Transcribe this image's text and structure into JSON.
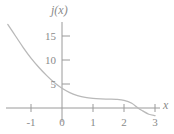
{
  "chart_data": {
    "type": "line",
    "title": "",
    "xlabel": "x",
    "ylabel": "j(x)",
    "xlim": [
      -1.75,
      3.25
    ],
    "ylim": [
      -1.6,
      17.5
    ],
    "grid": false,
    "legend": null,
    "axis_color": "#9a9a9a",
    "curve_color": "#b9b9b9",
    "label_color": "#8a8a8a",
    "background": "#ffffff",
    "xticks": [
      -1,
      0,
      1,
      2,
      3
    ],
    "xtick_labels": [
      "-1",
      "0",
      "1",
      "2",
      "3"
    ],
    "yticks": [
      5,
      10,
      15
    ],
    "ytick_labels": [
      "5",
      "10",
      "15"
    ],
    "series": [
      {
        "name": "j(x)",
        "x": [
          -1.75,
          -1.5,
          -1.25,
          -1.0,
          -0.75,
          -0.5,
          -0.25,
          0.0,
          0.25,
          0.5,
          0.75,
          1.0,
          1.25,
          1.5,
          1.75,
          2.0,
          2.25,
          2.45,
          2.6,
          2.8,
          3.0
        ],
        "y": [
          17.4,
          15.0,
          12.6,
          10.4,
          8.5,
          6.8,
          5.3,
          4.1,
          3.2,
          2.6,
          2.2,
          2.0,
          1.9,
          1.85,
          1.8,
          1.6,
          1.0,
          0.0,
          -0.6,
          -1.3,
          -1.6
        ]
      }
    ],
    "annotations": {
      "x_axis_arrow_label": "x",
      "y_axis_label": "j(x)"
    }
  },
  "labels": {
    "y_axis_title": "j(x)",
    "x_axis_title": "x",
    "y": {
      "t15": "15",
      "t10": "10",
      "t5": "5"
    },
    "x": {
      "tm1": "-1",
      "t0": "0",
      "t1": "1",
      "t2": "2",
      "t3": "3"
    }
  }
}
